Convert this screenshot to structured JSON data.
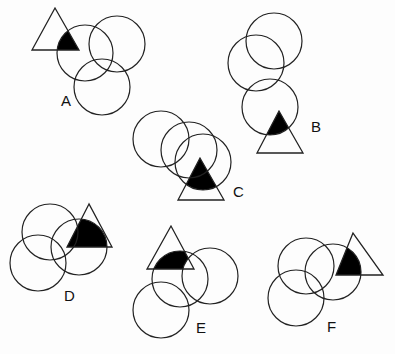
{
  "figures": [
    {
      "label": "A",
      "label_pos": [
        61,
        106
      ],
      "circles": [
        [
          85,
          53,
          28
        ],
        [
          117,
          44,
          28
        ],
        [
          102,
          87,
          28
        ]
      ],
      "triangle": [
        [
          55,
          8
        ],
        [
          32,
          50
        ],
        [
          79,
          50
        ]
      ],
      "fill_circle": 0,
      "exclude_circle": null
    },
    {
      "label": "B",
      "label_pos": [
        311,
        132
      ],
      "circles": [
        [
          274,
          41,
          28
        ],
        [
          256,
          63,
          28
        ],
        [
          270,
          107,
          28
        ]
      ],
      "triangle": [
        [
          279,
          111
        ],
        [
          257,
          153
        ],
        [
          303,
          153
        ]
      ],
      "fill_circle": 2,
      "exclude_circle": null
    },
    {
      "label": "C",
      "label_pos": [
        233,
        197
      ],
      "circles": [
        [
          161,
          139,
          28
        ],
        [
          189,
          150,
          28
        ],
        [
          203,
          162,
          28
        ]
      ],
      "triangle": [
        [
          200,
          158
        ],
        [
          178,
          200
        ],
        [
          224,
          200
        ]
      ],
      "fill_circle": 2,
      "exclude_circle": null
    },
    {
      "label": "D",
      "label_pos": [
        64,
        301
      ],
      "circles": [
        [
          50,
          232,
          28
        ],
        [
          38,
          263,
          28
        ],
        [
          79,
          247,
          28
        ]
      ],
      "triangle": [
        [
          89,
          204
        ],
        [
          67,
          247
        ],
        [
          112,
          247
        ]
      ],
      "fill_circle": 2,
      "exclude_circle": null
    },
    {
      "label": "E",
      "label_pos": [
        196,
        333
      ],
      "circles": [
        [
          180,
          279,
          28
        ],
        [
          210,
          276,
          28
        ],
        [
          161,
          310,
          28
        ]
      ],
      "triangle": [
        [
          171,
          226
        ],
        [
          147,
          269
        ],
        [
          194,
          269
        ]
      ],
      "fill_circle": 0,
      "exclude_circle": 1
    },
    {
      "label": "F",
      "label_pos": [
        327,
        332
      ],
      "circles": [
        [
          306,
          266,
          28
        ],
        [
          296,
          298,
          28
        ],
        [
          333,
          272,
          28
        ]
      ],
      "triangle": [
        [
          353,
          233
        ],
        [
          336,
          275
        ],
        [
          383,
          275
        ]
      ],
      "fill_circle": 2,
      "exclude_circle": null
    }
  ],
  "colors": {
    "stroke": "#222222",
    "fill": "#000000",
    "background": "#fdfdfd"
  }
}
